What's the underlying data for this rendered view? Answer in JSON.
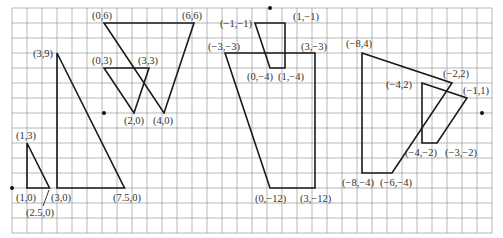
{
  "grid": {
    "x0": 12,
    "y0": 8,
    "cell": 15,
    "cols": 32,
    "rows": 15,
    "line_color": "#9a9a9a",
    "background": "#ffffff"
  },
  "chart_data": {
    "type": "diagram",
    "title": "",
    "figures": [
      {
        "name": "left",
        "origin_px": [
          12,
          188
        ],
        "unit_px": 15,
        "polygons": [
          {
            "name": "small-triangle",
            "vertices": [
              [
                1,
                0
              ],
              [
                1,
                3
              ],
              [
                2.5,
                0
              ]
            ]
          },
          {
            "name": "large-triangle",
            "vertices": [
              [
                3,
                0
              ],
              [
                3,
                9
              ],
              [
                7.5,
                0
              ]
            ]
          }
        ],
        "labels": [
          {
            "text": "(1,3)",
            "at": [
              1,
              3
            ]
          },
          {
            "text": "(1,0)",
            "at": [
              1,
              0
            ]
          },
          {
            "text": "(2.5,0)",
            "at": [
              2.5,
              0
            ]
          },
          {
            "text": "(3,0)",
            "at": [
              3,
              0
            ]
          },
          {
            "text": "(3,9)",
            "at": [
              3,
              9
            ]
          },
          {
            "text": "(7.5,0)",
            "at": [
              7.5,
              0
            ]
          }
        ]
      },
      {
        "name": "upper-left",
        "origin_px": [
          104,
          113
        ],
        "unit_px": 15,
        "polygons": [
          {
            "name": "large-inverted-triangle",
            "vertices": [
              [
                0,
                6
              ],
              [
                6,
                6
              ],
              [
                4,
                0
              ]
            ]
          },
          {
            "name": "small-inverted-triangle",
            "vertices": [
              [
                0,
                3
              ],
              [
                3,
                3
              ],
              [
                2,
                0
              ]
            ]
          }
        ],
        "labels": [
          {
            "text": "(0,6)",
            "at": [
              0,
              6
            ]
          },
          {
            "text": "(6,6)",
            "at": [
              6,
              6
            ]
          },
          {
            "text": "(0,3)",
            "at": [
              0,
              3
            ]
          },
          {
            "text": "(3,3)",
            "at": [
              3,
              3
            ]
          },
          {
            "text": "(2,0)",
            "at": [
              2,
              0
            ]
          },
          {
            "text": "(4,0)",
            "at": [
              4,
              0
            ]
          }
        ]
      },
      {
        "name": "middle",
        "origin_px": [
          270,
          8
        ],
        "unit_px": 15,
        "polygons": [
          {
            "name": "small-trapezoid",
            "vertices": [
              [
                -1,
                -1
              ],
              [
                1,
                -1
              ],
              [
                1,
                -4
              ],
              [
                0,
                -4
              ]
            ]
          },
          {
            "name": "large-trapezoid",
            "vertices": [
              [
                -3,
                -3
              ],
              [
                3,
                -3
              ],
              [
                3,
                -12
              ],
              [
                0,
                -12
              ]
            ]
          }
        ],
        "labels": [
          {
            "text": "(−1,−1)",
            "at": [
              -1,
              -1
            ]
          },
          {
            "text": "(1,−1)",
            "at": [
              1,
              -1
            ]
          },
          {
            "text": "(0,−4)",
            "at": [
              0,
              -4
            ]
          },
          {
            "text": "(1,−4)",
            "at": [
              1,
              -4
            ]
          },
          {
            "text": "(−3,−3)",
            "at": [
              -3,
              -3
            ]
          },
          {
            "text": "(3,−3)",
            "at": [
              3,
              -3
            ]
          },
          {
            "text": "(0,−12)",
            "at": [
              0,
              -12
            ]
          },
          {
            "text": "(3,−12)",
            "at": [
              3,
              -12
            ]
          }
        ]
      },
      {
        "name": "right",
        "origin_px": [
          482,
          113
        ],
        "unit_px": 15,
        "polygons": [
          {
            "name": "large-quadrilateral",
            "vertices": [
              [
                -8,
                4
              ],
              [
                -2,
                2
              ],
              [
                -6,
                -4
              ],
              [
                -8,
                -4
              ]
            ]
          },
          {
            "name": "small-quadrilateral",
            "vertices": [
              [
                -4,
                2
              ],
              [
                -1,
                1
              ],
              [
                -3,
                -2
              ],
              [
                -4,
                -2
              ]
            ]
          }
        ],
        "labels": [
          {
            "text": "(−8,4)",
            "at": [
              -8,
              4
            ]
          },
          {
            "text": "(−2,2)",
            "at": [
              -2,
              2
            ]
          },
          {
            "text": "(−4,2)",
            "at": [
              -4,
              2
            ]
          },
          {
            "text": "(−1,1)",
            "at": [
              -1,
              1
            ]
          },
          {
            "text": "(−4,−2)",
            "at": [
              -4,
              -2
            ]
          },
          {
            "text": "(−3,−2)",
            "at": [
              -3,
              -2
            ]
          },
          {
            "text": "(−8,−4)",
            "at": [
              -8,
              -4
            ]
          },
          {
            "text": "(−6,−4)",
            "at": [
              -6,
              -4
            ]
          }
        ]
      }
    ]
  },
  "labels": {
    "l_1_3": "(1,3)",
    "l_1_0": "(1,0)",
    "l_2p5_0": "(2.5,0)",
    "l_3_0": "(3,0)",
    "l_3_9": "(3,9)",
    "l_7p5_0": "(7.5,0)",
    "l_0_6": "(0,6)",
    "l_6_6": "(6,6)",
    "l_0_3": "(0,3)",
    "l_3_3": "(3,3)",
    "l_2_0": "(2,0)",
    "l_4_0": "(4,0)",
    "m_n1_n1": "(−1,−1)",
    "m_1_n1": "(1,−1)",
    "m_0_n4": "(0,−4)",
    "m_1_n4": "(1,−4)",
    "m_n3_n3": "(−3,−3)",
    "m_3_n3": "(3,−3)",
    "m_0_n12": "(0,−12)",
    "m_3_n12": "(3,−12)",
    "r_n8_4": "(−8,4)",
    "r_n2_2": "(−2,2)",
    "r_n4_2": "(−4,2)",
    "r_n1_1": "(−1,1)",
    "r_n4_n2": "(−4,−2)",
    "r_n3_n2": "(−3,−2)",
    "r_n8_n4": "(−8,−4)",
    "r_n6_n4": "(−6,−4)"
  }
}
